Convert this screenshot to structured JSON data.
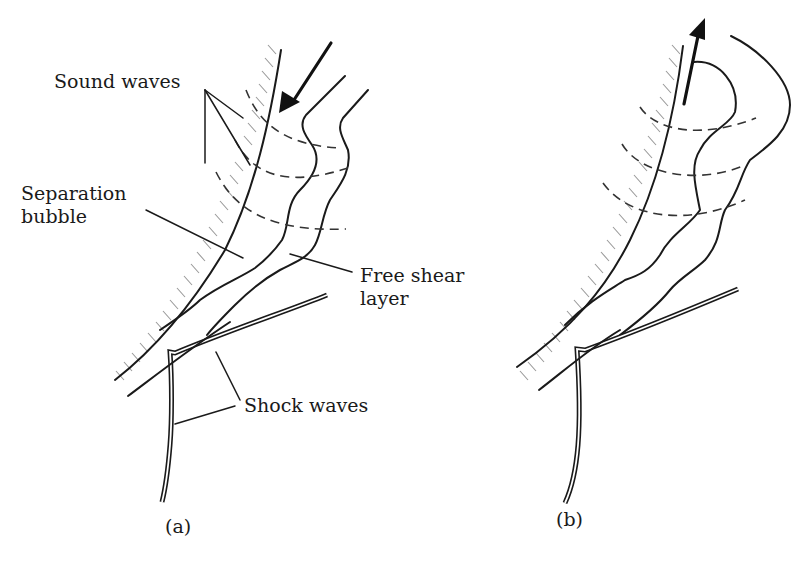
{
  "figure": {
    "panels": [
      {
        "id": "a",
        "caption": "(a)",
        "labels": {
          "sound_waves": "Sound waves",
          "separation_line1": "Separation",
          "separation_line2": "bubble",
          "free_shear_line1": "Free shear",
          "free_shear_line2": "layer",
          "shock_waves": "Shock waves"
        },
        "flow_direction": "inward"
      },
      {
        "id": "b",
        "caption": "(b)",
        "flow_direction": "outward"
      }
    ],
    "colors": {
      "line": "#1a1a1a",
      "hatch": "#9a9a9a",
      "background": "#ffffff"
    }
  }
}
